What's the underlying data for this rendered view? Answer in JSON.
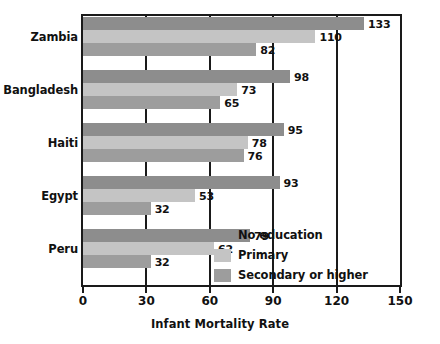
{
  "chart_data": {
    "type": "bar",
    "orientation": "horizontal",
    "title": "",
    "xlabel": "Infant Mortality Rate",
    "ylabel": "",
    "xlim": [
      0,
      150
    ],
    "xticks": [
      0,
      30,
      60,
      90,
      120,
      150
    ],
    "xtick_labels": [
      "0",
      "30",
      "60",
      "90",
      "120",
      "150"
    ],
    "grid": true,
    "grid_axis": "x",
    "legend_position": "bottom-right-inside",
    "categories": [
      "Zambia",
      "Bangladesh",
      "Haiti",
      "Egypt",
      "Peru"
    ],
    "series": [
      {
        "name": "No education",
        "color": "#8d8d8d",
        "values": [
          133,
          98,
          95,
          93,
          79
        ],
        "value_labels": [
          "133",
          "98",
          "95",
          "93",
          "79"
        ]
      },
      {
        "name": "Primary",
        "color": "#c4c4c4",
        "values": [
          110,
          73,
          78,
          53,
          62
        ],
        "value_labels": [
          "110",
          "73",
          "78",
          "53",
          "62"
        ]
      },
      {
        "name": "Secondary or higher",
        "color": "#9d9d9d",
        "values": [
          82,
          65,
          76,
          32,
          32
        ],
        "value_labels": [
          "82",
          "65",
          "76",
          "32",
          "32"
        ]
      }
    ]
  },
  "axis": {
    "title": "Infant Mortality Rate",
    "ticks": [
      {
        "value": 0,
        "label": "0"
      },
      {
        "value": 30,
        "label": "30"
      },
      {
        "value": 60,
        "label": "60"
      },
      {
        "value": 90,
        "label": "90"
      },
      {
        "value": 120,
        "label": "120"
      },
      {
        "value": 150,
        "label": "150"
      }
    ]
  },
  "categories": [
    {
      "label": "Zambia"
    },
    {
      "label": "Bangladesh"
    },
    {
      "label": "Haiti"
    },
    {
      "label": "Egypt"
    },
    {
      "label": "Peru"
    }
  ],
  "legend": {
    "items": [
      {
        "label": "No education",
        "color": "#8d8d8d"
      },
      {
        "label": "Primary",
        "color": "#c4c4c4"
      },
      {
        "label": "Secondary or higher",
        "color": "#9d9d9d"
      }
    ]
  },
  "colors": {
    "no_education": "#8d8d8d",
    "primary": "#c4c4c4",
    "secondary_or_higher": "#9d9d9d",
    "axis": "#1a1a1a",
    "text": "#111111",
    "background": "#ffffff"
  }
}
